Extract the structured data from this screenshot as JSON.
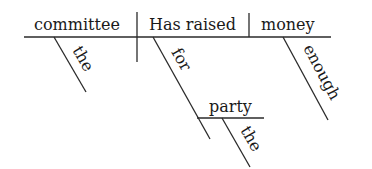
{
  "diagram": {
    "type": "sentence-diagram",
    "subject": "committee",
    "verb": "Has raised",
    "object": "money",
    "modifiers": {
      "subject_article": "the",
      "verb_preposition": "for",
      "prep_object": "party",
      "prep_object_article": "the",
      "object_adjective": "enough"
    }
  }
}
